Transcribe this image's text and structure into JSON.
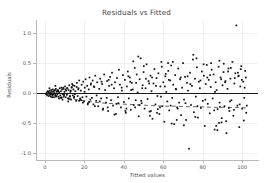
{
  "chart_data": {
    "type": "scatter",
    "title": "Residuals vs Fitted",
    "xlabel": "Fitted values",
    "ylabel": "Residuals",
    "xlim": [
      -4,
      108
    ],
    "ylim": [
      -1.12,
      1.22
    ],
    "xticks": [
      0,
      20,
      40,
      60,
      80,
      100
    ],
    "xticklabels": [
      "0",
      "20",
      "40",
      "60",
      "80",
      "100"
    ],
    "yticks": [
      1.0,
      0.5,
      0.0,
      -0.5,
      -1.0
    ],
    "yticklabels": [
      "1.0",
      "0.5",
      "0.0",
      "-0.5",
      "-1.0"
    ],
    "grid": true,
    "legend": "none",
    "marker": "small-black-square",
    "marker_color": "#111111",
    "reference_line": {
      "type": "horizontal",
      "y": 0.0,
      "style": "solid",
      "color": "#1a1a1a"
    },
    "trend_line": {
      "type": "lowess",
      "style": "dashed",
      "color": "#555555",
      "x": [
        1,
        6,
        12,
        18,
        24,
        30,
        36,
        42,
        48,
        54,
        60,
        66,
        72,
        78,
        84,
        90,
        96,
        102
      ],
      "y": [
        -0.01,
        -0.05,
        -0.09,
        -0.12,
        -0.15,
        -0.17,
        -0.18,
        -0.19,
        -0.2,
        -0.21,
        -0.22,
        -0.22,
        -0.23,
        -0.23,
        -0.24,
        -0.24,
        -0.24,
        -0.25
      ]
    },
    "points": [
      [
        0.6,
        -0.02
      ],
      [
        0.9,
        0.01
      ],
      [
        1.1,
        -0.04
      ],
      [
        1.4,
        0.03
      ],
      [
        1.6,
        -0.01
      ],
      [
        1.8,
        0.02
      ],
      [
        2.0,
        -0.05
      ],
      [
        2.2,
        0.0
      ],
      [
        2.4,
        0.04
      ],
      [
        2.6,
        -0.03
      ],
      [
        2.8,
        0.01
      ],
      [
        3.0,
        -0.06
      ],
      [
        3.2,
        0.05
      ],
      [
        3.4,
        -0.02
      ],
      [
        3.6,
        0.02
      ],
      [
        3.8,
        -0.04
      ],
      [
        4.0,
        0.06
      ],
      [
        4.2,
        -0.01
      ],
      [
        4.4,
        0.03
      ],
      [
        4.6,
        -0.07
      ],
      [
        4.8,
        0.0
      ],
      [
        5.0,
        0.04
      ],
      [
        5.2,
        -0.03
      ],
      [
        5.5,
        0.07
      ],
      [
        5.8,
        -0.05
      ],
      [
        6.0,
        0.02
      ],
      [
        6.3,
        -0.02
      ],
      [
        6.6,
        0.05
      ],
      [
        6.9,
        -0.06
      ],
      [
        7.2,
        0.01
      ],
      [
        7.5,
        0.08
      ],
      [
        7.8,
        -0.04
      ],
      [
        8.1,
        0.03
      ],
      [
        8.4,
        -0.08
      ],
      [
        8.7,
        0.06
      ],
      [
        9.0,
        -0.02
      ],
      [
        9.3,
        0.09
      ],
      [
        9.6,
        -0.05
      ],
      [
        9.9,
        0.02
      ],
      [
        10.2,
        0.11
      ],
      [
        10.5,
        -0.07
      ],
      [
        10.8,
        0.04
      ],
      [
        11.1,
        -0.03
      ],
      [
        11.4,
        0.08
      ],
      [
        11.7,
        -0.09
      ],
      [
        12.0,
        0.05
      ],
      [
        12.3,
        0.13
      ],
      [
        12.6,
        -0.06
      ],
      [
        12.9,
        0.02
      ],
      [
        13.2,
        -0.11
      ],
      [
        13.5,
        0.09
      ],
      [
        13.8,
        0.15
      ],
      [
        14.1,
        -0.04
      ],
      [
        14.4,
        0.06
      ],
      [
        14.7,
        -0.08
      ],
      [
        15.0,
        0.12
      ],
      [
        15.4,
        0.03
      ],
      [
        15.8,
        -0.13
      ],
      [
        16.2,
        0.17
      ],
      [
        16.6,
        -0.05
      ],
      [
        17.0,
        0.08
      ],
      [
        17.4,
        0.21
      ],
      [
        17.8,
        -0.1
      ],
      [
        18.2,
        0.04
      ],
      [
        18.6,
        0.14
      ],
      [
        19.0,
        -0.07
      ],
      [
        19.4,
        0.19
      ],
      [
        19.8,
        -0.14
      ],
      [
        20.2,
        0.09
      ],
      [
        20.6,
        0.23
      ],
      [
        21.0,
        -0.06
      ],
      [
        21.4,
        0.12
      ],
      [
        21.8,
        -0.17
      ],
      [
        22.2,
        0.06
      ],
      [
        22.6,
        0.26
      ],
      [
        23.0,
        -0.11
      ],
      [
        23.4,
        0.16
      ],
      [
        23.8,
        -0.08
      ],
      [
        24.2,
        0.21
      ],
      [
        24.6,
        -0.19
      ],
      [
        25.0,
        0.1
      ],
      [
        25.5,
        0.29
      ],
      [
        26.0,
        -0.13
      ],
      [
        26.5,
        0.18
      ],
      [
        27.0,
        -0.22
      ],
      [
        27.5,
        0.07
      ],
      [
        28.0,
        0.24
      ],
      [
        28.5,
        -0.09
      ],
      [
        29.0,
        0.15
      ],
      [
        29.5,
        -0.26
      ],
      [
        30.0,
        0.31
      ],
      [
        30.5,
        0.05
      ],
      [
        31.0,
        -0.16
      ],
      [
        31.5,
        0.2
      ],
      [
        32.0,
        -0.3
      ],
      [
        32.5,
        0.12
      ],
      [
        33.0,
        0.27
      ],
      [
        33.5,
        -0.12
      ],
      [
        34.0,
        0.34
      ],
      [
        34.5,
        -0.21
      ],
      [
        35.0,
        0.08
      ],
      [
        35.5,
        0.18
      ],
      [
        36.0,
        -0.35
      ],
      [
        36.5,
        0.25
      ],
      [
        37.0,
        -0.07
      ],
      [
        37.5,
        0.39
      ],
      [
        38.0,
        0.14
      ],
      [
        38.5,
        -0.24
      ],
      [
        39.0,
        0.04
      ],
      [
        39.5,
        0.3
      ],
      [
        40.0,
        -0.15
      ],
      [
        40.5,
        0.22
      ],
      [
        41.0,
        -0.33
      ],
      [
        41.5,
        0.11
      ],
      [
        42.0,
        0.36
      ],
      [
        42.5,
        -0.09
      ],
      [
        43.0,
        0.26
      ],
      [
        43.5,
        -0.28
      ],
      [
        44.0,
        0.17
      ],
      [
        44.5,
        0.06
      ],
      [
        45.0,
        -0.2
      ],
      [
        45.5,
        0.42
      ],
      [
        46.0,
        -0.12
      ],
      [
        46.5,
        0.31
      ],
      [
        47.0,
        0.01
      ],
      [
        47.5,
        -0.39
      ],
      [
        48.0,
        0.23
      ],
      [
        48.5,
        0.58
      ],
      [
        49.0,
        -0.17
      ],
      [
        49.5,
        0.13
      ],
      [
        50.0,
        0.35
      ],
      [
        50.5,
        -0.26
      ],
      [
        51.0,
        0.08
      ],
      [
        51.5,
        0.48
      ],
      [
        52.0,
        -0.1
      ],
      [
        52.5,
        0.2
      ],
      [
        53.0,
        -0.31
      ],
      [
        53.5,
        0.29
      ],
      [
        54.0,
        0.03
      ],
      [
        54.5,
        -0.43
      ],
      [
        55.0,
        0.16
      ],
      [
        55.5,
        0.4
      ],
      [
        56.0,
        -0.19
      ],
      [
        56.5,
        0.25
      ],
      [
        57.0,
        -0.05
      ],
      [
        57.5,
        0.33
      ],
      [
        58.0,
        -0.35
      ],
      [
        58.5,
        0.11
      ],
      [
        59.0,
        0.52
      ],
      [
        59.5,
        -0.22
      ],
      [
        60.0,
        0.18
      ],
      [
        60.5,
        -0.48
      ],
      [
        61.0,
        0.28
      ],
      [
        61.5,
        0.02
      ],
      [
        62.0,
        -0.14
      ],
      [
        62.5,
        0.37
      ],
      [
        63.0,
        -0.29
      ],
      [
        63.5,
        0.21
      ],
      [
        64.0,
        0.46
      ],
      [
        64.5,
        -0.08
      ],
      [
        65.0,
        0.14
      ],
      [
        65.5,
        -0.52
      ],
      [
        66.0,
        0.3
      ],
      [
        66.5,
        0.06
      ],
      [
        67.0,
        -0.24
      ],
      [
        67.5,
        0.41
      ],
      [
        68.0,
        -0.16
      ],
      [
        68.5,
        0.23
      ],
      [
        69.0,
        -0.37
      ],
      [
        69.5,
        0.09
      ],
      [
        70.0,
        0.5
      ],
      [
        70.5,
        -0.11
      ],
      [
        71.0,
        0.27
      ],
      [
        71.5,
        -0.45
      ],
      [
        72.0,
        0.17
      ],
      [
        72.5,
        0.04
      ],
      [
        73.0,
        -0.93
      ],
      [
        73.5,
        0.34
      ],
      [
        74.0,
        -0.2
      ],
      [
        74.5,
        0.12
      ],
      [
        75.0,
        0.56
      ],
      [
        75.5,
        -0.32
      ],
      [
        76.0,
        0.24
      ],
      [
        76.5,
        -0.06
      ],
      [
        77.0,
        0.43
      ],
      [
        77.5,
        -0.41
      ],
      [
        78.0,
        0.19
      ],
      [
        78.5,
        0.08
      ],
      [
        79.0,
        -0.25
      ],
      [
        79.5,
        0.36
      ],
      [
        80.0,
        -0.13
      ],
      [
        80.5,
        0.29
      ],
      [
        81.0,
        -0.55
      ],
      [
        81.5,
        0.15
      ],
      [
        82.0,
        0.47
      ],
      [
        82.5,
        -0.18
      ],
      [
        83.0,
        0.22
      ],
      [
        83.5,
        -0.34
      ],
      [
        84.0,
        0.1
      ],
      [
        84.5,
        0.39
      ],
      [
        85.0,
        -0.09
      ],
      [
        85.5,
        0.31
      ],
      [
        86.0,
        -0.61
      ],
      [
        86.5,
        0.18
      ],
      [
        87.0,
        0.05
      ],
      [
        87.5,
        -0.27
      ],
      [
        88.0,
        0.44
      ],
      [
        88.5,
        -0.16
      ],
      [
        89.0,
        0.26
      ],
      [
        89.5,
        -0.49
      ],
      [
        90.0,
        0.13
      ],
      [
        90.5,
        0.35
      ],
      [
        91.0,
        -0.22
      ],
      [
        91.5,
        0.2
      ],
      [
        92.0,
        -0.67
      ],
      [
        92.5,
        0.07
      ],
      [
        93.0,
        0.41
      ],
      [
        93.5,
        -0.3
      ],
      [
        94.0,
        0.24
      ],
      [
        94.5,
        -0.12
      ],
      [
        95.0,
        0.52
      ],
      [
        95.5,
        -0.38
      ],
      [
        96.0,
        0.16
      ],
      [
        96.5,
        0.33
      ],
      [
        97.0,
        1.13
      ],
      [
        97.5,
        -0.21
      ],
      [
        98.0,
        0.28
      ],
      [
        98.5,
        -0.57
      ],
      [
        99.0,
        0.11
      ],
      [
        99.5,
        0.45
      ],
      [
        100.0,
        -0.26
      ],
      [
        100.5,
        0.19
      ],
      [
        101.0,
        -0.08
      ],
      [
        101.5,
        0.37
      ],
      [
        102.0,
        -0.33
      ],
      [
        15.2,
        -0.02
      ],
      [
        16.9,
        0.06
      ],
      [
        18.3,
        -0.12
      ],
      [
        20.1,
        0.02
      ],
      [
        22.4,
        -0.15
      ],
      [
        24.8,
        0.11
      ],
      [
        26.2,
        -0.04
      ],
      [
        28.7,
        0.19
      ],
      [
        31.3,
        -0.08
      ],
      [
        33.8,
        0.14
      ],
      [
        36.2,
        -0.18
      ],
      [
        38.9,
        0.09
      ],
      [
        41.3,
        -0.26
      ],
      [
        43.7,
        0.05
      ],
      [
        46.2,
        0.17
      ],
      [
        48.8,
        -0.13
      ],
      [
        51.2,
        0.24
      ],
      [
        53.7,
        -0.3
      ],
      [
        56.3,
        0.12
      ],
      [
        58.8,
        -0.06
      ],
      [
        61.2,
        0.32
      ],
      [
        63.7,
        -0.21
      ],
      [
        66.3,
        0.07
      ],
      [
        68.8,
        0.26
      ],
      [
        71.2,
        -0.17
      ],
      [
        73.7,
        0.15
      ],
      [
        76.2,
        -0.4
      ],
      [
        78.8,
        0.21
      ],
      [
        81.3,
        -0.11
      ],
      [
        83.7,
        0.3
      ],
      [
        86.2,
        0.02
      ],
      [
        88.7,
        -0.23
      ],
      [
        91.3,
        0.18
      ],
      [
        93.8,
        -0.14
      ],
      [
        96.2,
        0.25
      ],
      [
        98.7,
        -0.19
      ],
      [
        101.2,
        0.09
      ],
      [
        5.3,
        0.12
      ],
      [
        7.1,
        -0.09
      ],
      [
        9.4,
        0.07
      ],
      [
        11.8,
        -0.14
      ],
      [
        13.6,
        0.1
      ],
      [
        2.3,
        0.08
      ],
      [
        3.7,
        -0.07
      ],
      [
        6.2,
        0.04
      ],
      [
        8.9,
        -0.11
      ],
      [
        10.4,
        0.06
      ],
      [
        12.7,
        -0.05
      ],
      [
        14.2,
        0.13
      ],
      [
        44.8,
        0.53
      ],
      [
        47.3,
        0.61
      ],
      [
        50.1,
        0.45
      ],
      [
        59.2,
        0.44
      ],
      [
        62.4,
        0.5
      ],
      [
        64.8,
        0.52
      ],
      [
        75.2,
        0.64
      ],
      [
        76.8,
        0.58
      ],
      [
        80.4,
        0.48
      ],
      [
        84.2,
        0.5
      ],
      [
        88.4,
        0.54
      ],
      [
        90.6,
        0.49
      ],
      [
        94.2,
        0.42
      ],
      [
        99.2,
        0.4
      ],
      [
        86.8,
        -0.55
      ],
      [
        87.4,
        -0.62
      ],
      [
        88.2,
        -0.5
      ],
      [
        89.6,
        -0.42
      ],
      [
        91.8,
        -0.47
      ],
      [
        64.2,
        -0.51
      ],
      [
        66.8,
        -0.45
      ],
      [
        70.4,
        -0.54
      ],
      [
        35.2,
        -0.36
      ],
      [
        40.8,
        -0.3
      ],
      [
        53.2,
        -0.38
      ],
      [
        56.8,
        -0.33
      ],
      [
        29.3,
        -0.28
      ],
      [
        31.8,
        -0.24
      ],
      [
        25.3,
        -0.22
      ],
      [
        21.7,
        -0.19
      ],
      [
        19.2,
        -0.16
      ],
      [
        17.3,
        -0.13
      ],
      [
        101.8,
        0.26
      ],
      [
        100.8,
        -0.46
      ],
      [
        95.8,
        -0.28
      ],
      [
        92.8,
        0.36
      ],
      [
        97.8,
        0.34
      ],
      [
        99.8,
        0.22
      ],
      [
        43.2,
        0.19
      ],
      [
        45.7,
        -0.24
      ],
      [
        49.3,
        0.08
      ],
      [
        52.8,
        0.16
      ],
      [
        57.2,
        -0.27
      ],
      [
        60.8,
        0.11
      ],
      [
        4.1,
        -0.02
      ],
      [
        4.9,
        0.05
      ],
      [
        5.6,
        -0.06
      ],
      [
        6.8,
        0.03
      ],
      [
        7.9,
        -0.08
      ],
      [
        8.3,
        0.09
      ],
      [
        9.7,
        -0.03
      ],
      [
        11.2,
        0.08
      ],
      [
        12.1,
        -0.1
      ],
      [
        13.1,
        0.04
      ],
      [
        14.8,
        -0.06
      ],
      [
        16.1,
        0.1
      ],
      [
        17.9,
        -0.09
      ],
      [
        23.2,
        0.14
      ],
      [
        27.8,
        -0.14
      ],
      [
        32.3,
        0.22
      ],
      [
        37.2,
        -0.17
      ],
      [
        42.3,
        0.28
      ],
      [
        47.8,
        -0.2
      ],
      [
        54.3,
        0.26
      ],
      [
        58.3,
        -0.24
      ],
      [
        62.8,
        0.22
      ],
      [
        67.3,
        -0.26
      ],
      [
        72.3,
        0.28
      ],
      [
        77.3,
        -0.22
      ],
      [
        82.3,
        0.26
      ],
      [
        85.8,
        -0.29
      ],
      [
        89.3,
        0.23
      ],
      [
        93.2,
        -0.25
      ],
      [
        98.2,
        0.29
      ],
      [
        102.3,
        -0.21
      ]
    ]
  }
}
